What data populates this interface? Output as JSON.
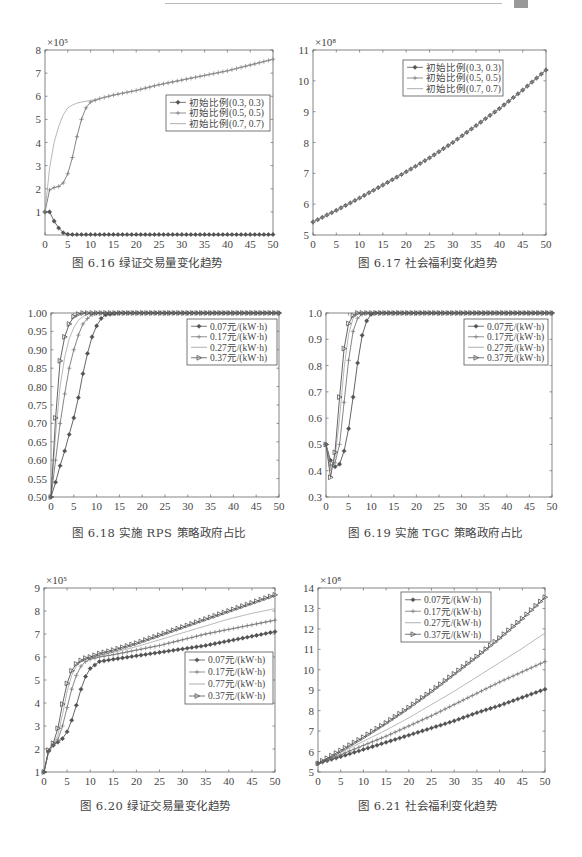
{
  "page": {
    "header_decoration": true
  },
  "figures": [
    {
      "id": "fig-6-16",
      "caption": "图 6.16   绿证交易量变化趋势",
      "caption_pos": [
        72,
        254
      ],
      "box": [
        45,
        50,
        273,
        235
      ],
      "xlim": [
        0,
        50
      ],
      "ylim": [
        0,
        8
      ],
      "xticks": [
        0,
        5,
        10,
        15,
        20,
        25,
        30,
        35,
        40,
        45,
        50
      ],
      "yticks": [
        1,
        2,
        3,
        4,
        5,
        6,
        7,
        8
      ],
      "ytick_labels": [
        "1",
        "2",
        "3",
        "4",
        "5",
        "6",
        "7",
        "8"
      ],
      "ytick_show_zero_label": false,
      "exponent": "×10⁵",
      "legend": {
        "pos": [
          166,
          95
        ],
        "w": 104,
        "h": 36
      }
    },
    {
      "id": "fig-6-17",
      "caption": "图 6.17   社会福利变化趋势",
      "caption_pos": [
        358,
        254
      ],
      "box": [
        313,
        50,
        546,
        235
      ],
      "xlim": [
        0,
        50
      ],
      "ylim": [
        5,
        11
      ],
      "xticks": [
        0,
        5,
        10,
        15,
        20,
        25,
        30,
        35,
        40,
        45,
        50
      ],
      "yticks": [
        5,
        6,
        7,
        8,
        9,
        10,
        11
      ],
      "ytick_labels": [
        "5",
        "6",
        "7",
        "8",
        "9",
        "10",
        "11"
      ],
      "exponent": "×10⁸",
      "legend": {
        "pos": [
          403,
          60
        ],
        "w": 100,
        "h": 36
      }
    },
    {
      "id": "fig-6-18",
      "caption": "图 6.18   实施 RPS 策略政府占比",
      "caption_pos": [
        72,
        525
      ],
      "box": [
        51,
        313,
        279,
        497
      ],
      "xlim": [
        0,
        50
      ],
      "ylim": [
        0.5,
        1.0
      ],
      "xticks": [
        0,
        5,
        10,
        15,
        20,
        25,
        30,
        35,
        40,
        45,
        50
      ],
      "yticks": [
        0.5,
        0.55,
        0.6,
        0.65,
        0.7,
        0.75,
        0.8,
        0.85,
        0.9,
        0.95,
        1.0
      ],
      "ytick_labels": [
        "0.50",
        "0.55",
        "0.60",
        "0.65",
        "0.70",
        "0.75",
        "0.80",
        "0.85",
        "0.90",
        "0.95",
        "1.00"
      ],
      "exponent": "",
      "legend": {
        "pos": [
          187,
          319
        ],
        "w": 90,
        "h": 46
      }
    },
    {
      "id": "fig-6-19",
      "caption": "图 6.19   实施 TGC 策略政府占比",
      "caption_pos": [
        348,
        525
      ],
      "box": [
        326,
        313,
        552,
        497
      ],
      "xlim": [
        0,
        50
      ],
      "ylim": [
        0.3,
        1.0
      ],
      "xticks": [
        0,
        5,
        10,
        15,
        20,
        25,
        30,
        35,
        40,
        45,
        50
      ],
      "yticks": [
        0.3,
        0.4,
        0.5,
        0.6,
        0.7,
        0.8,
        0.9,
        1.0
      ],
      "ytick_labels": [
        "0.3",
        "0.4",
        "0.5",
        "0.6",
        "0.7",
        "0.8",
        "0.9",
        "1.0"
      ],
      "exponent": "",
      "legend": {
        "pos": [
          464,
          319
        ],
        "w": 84,
        "h": 46
      }
    },
    {
      "id": "fig-6-20",
      "caption": "图 6.20   绿证交易量变化趋势",
      "caption_pos": [
        80,
        797
      ],
      "box": [
        44,
        588,
        275,
        772
      ],
      "xlim": [
        0,
        50
      ],
      "ylim": [
        1,
        9
      ],
      "xticks": [
        0,
        5,
        10,
        15,
        20,
        25,
        30,
        35,
        40,
        45,
        50
      ],
      "yticks": [
        1,
        2,
        3,
        4,
        5,
        6,
        7,
        8,
        9
      ],
      "ytick_labels": [
        "1",
        "2",
        "3",
        "4",
        "5",
        "6",
        "7",
        "8",
        "9"
      ],
      "exponent": "×10⁵",
      "legend": {
        "pos": [
          185,
          652
        ],
        "w": 88,
        "h": 52
      }
    },
    {
      "id": "fig-6-21",
      "caption": "图 6.21   社会福利变化趋势",
      "caption_pos": [
        358,
        797
      ],
      "box": [
        318,
        588,
        545,
        772
      ],
      "xlim": [
        0,
        50
      ],
      "ylim": [
        5,
        14
      ],
      "xticks": [
        0,
        5,
        10,
        15,
        20,
        25,
        30,
        35,
        40,
        45,
        50
      ],
      "yticks": [
        5,
        6,
        7,
        8,
        9,
        10,
        11,
        12,
        13,
        14
      ],
      "ytick_labels": [
        "5",
        "6",
        "7",
        "8",
        "9",
        "10",
        "11",
        "12",
        "13",
        "14"
      ],
      "exponent": "×10⁸",
      "legend": {
        "pos": [
          401,
          592
        ],
        "w": 90,
        "h": 50
      }
    }
  ],
  "chart_data": [
    {
      "type": "line",
      "title": "图 6.16 绿证交易量变化趋势",
      "xlabel": "",
      "ylabel": "",
      "y_multiplier": "×10^5",
      "xlim": [
        0,
        50
      ],
      "ylim": [
        0,
        8
      ],
      "grid": false,
      "legend_position": "upper right (inside)",
      "x": [
        0,
        1,
        2,
        3,
        4,
        5,
        6,
        7,
        8,
        9,
        10,
        12,
        15,
        20,
        25,
        30,
        35,
        40,
        45,
        50
      ],
      "series": [
        {
          "name": "初始比例(0.3, 0.3)",
          "marker": "asterisk",
          "values": [
            1.0,
            1.0,
            0.6,
            0.3,
            0.1,
            0.03,
            0.02,
            0.02,
            0.02,
            0.02,
            0.02,
            0.02,
            0.02,
            0.02,
            0.02,
            0.02,
            0.02,
            0.02,
            0.02,
            0.02
          ]
        },
        {
          "name": "初始比例(0.5, 0.5)",
          "marker": "plus",
          "values": [
            1.0,
            1.95,
            2.05,
            2.1,
            2.25,
            2.65,
            3.35,
            4.25,
            5.0,
            5.5,
            5.75,
            5.9,
            6.05,
            6.25,
            6.5,
            6.7,
            6.9,
            7.1,
            7.35,
            7.6
          ]
        },
        {
          "name": "初始比例(0.7, 0.7)",
          "marker": "none",
          "values": [
            1.0,
            2.9,
            4.0,
            4.7,
            5.2,
            5.5,
            5.62,
            5.7,
            5.75,
            5.78,
            5.82,
            5.9,
            6.05,
            6.25,
            6.5,
            6.7,
            6.9,
            7.1,
            7.35,
            7.6
          ]
        }
      ]
    },
    {
      "type": "line",
      "title": "图 6.17 社会福利变化趋势",
      "xlabel": "",
      "ylabel": "",
      "y_multiplier": "×10^8",
      "xlim": [
        0,
        50
      ],
      "ylim": [
        5,
        11
      ],
      "grid": false,
      "legend_position": "upper center (inside)",
      "x": [
        0,
        5,
        10,
        15,
        20,
        25,
        30,
        35,
        40,
        45,
        50
      ],
      "series": [
        {
          "name": "初始比例(0.3, 0.3)",
          "marker": "asterisk",
          "values": [
            5.42,
            5.8,
            6.2,
            6.62,
            7.05,
            7.5,
            8.0,
            8.55,
            9.1,
            9.7,
            10.35
          ]
        },
        {
          "name": "初始比例(0.5, 0.5)",
          "marker": "plus",
          "values": [
            5.42,
            5.8,
            6.2,
            6.62,
            7.05,
            7.5,
            8.0,
            8.55,
            9.1,
            9.7,
            10.35
          ]
        },
        {
          "name": "初始比例(0.7, 0.7)",
          "marker": "none",
          "values": [
            5.42,
            5.8,
            6.2,
            6.62,
            7.05,
            7.5,
            8.0,
            8.55,
            9.1,
            9.7,
            10.35
          ]
        }
      ]
    },
    {
      "type": "line",
      "title": "图 6.18 实施 RPS 策略政府占比",
      "xlabel": "",
      "ylabel": "",
      "xlim": [
        0,
        50
      ],
      "ylim": [
        0.5,
        1.0
      ],
      "grid": false,
      "legend_position": "upper right (inside)",
      "x": [
        0,
        1,
        2,
        3,
        4,
        5,
        6,
        7,
        8,
        9,
        10,
        11,
        12,
        15,
        20,
        25,
        30,
        35,
        40,
        45,
        50
      ],
      "series": [
        {
          "name": "0.07元/(kW·h)",
          "marker": "asterisk",
          "values": [
            0.5,
            0.54,
            0.585,
            0.625,
            0.67,
            0.715,
            0.77,
            0.835,
            0.89,
            0.935,
            0.965,
            0.985,
            0.995,
            1.0,
            1.0,
            1.0,
            1.0,
            1.0,
            1.0,
            1.0,
            1.0
          ]
        },
        {
          "name": "0.17元/(kW·h)",
          "marker": "plus",
          "values": [
            0.5,
            0.6,
            0.7,
            0.78,
            0.85,
            0.9,
            0.94,
            0.97,
            0.985,
            0.995,
            1.0,
            1.0,
            1.0,
            1.0,
            1.0,
            1.0,
            1.0,
            1.0,
            1.0,
            1.0,
            1.0
          ]
        },
        {
          "name": "0.27元/(kW·h)",
          "marker": "none",
          "values": [
            0.5,
            0.67,
            0.8,
            0.88,
            0.93,
            0.96,
            0.98,
            0.99,
            0.997,
            1.0,
            1.0,
            1.0,
            1.0,
            1.0,
            1.0,
            1.0,
            1.0,
            1.0,
            1.0,
            1.0,
            1.0
          ]
        },
        {
          "name": "0.37元/(kW·h)",
          "marker": "triangle-right",
          "values": [
            0.5,
            0.715,
            0.87,
            0.935,
            0.97,
            0.99,
            0.997,
            1.0,
            1.0,
            1.0,
            1.0,
            1.0,
            1.0,
            1.0,
            1.0,
            1.0,
            1.0,
            1.0,
            1.0,
            1.0,
            1.0
          ]
        }
      ]
    },
    {
      "type": "line",
      "title": "图 6.19 实施 TGC 策略政府占比",
      "xlabel": "",
      "ylabel": "",
      "xlim": [
        0,
        50
      ],
      "ylim": [
        0.3,
        1.0
      ],
      "grid": false,
      "legend_position": "upper right (inside)",
      "x": [
        0,
        1,
        2,
        3,
        4,
        5,
        6,
        7,
        8,
        9,
        10,
        11,
        12,
        15,
        20,
        25,
        30,
        35,
        40,
        45,
        50
      ],
      "series": [
        {
          "name": "0.07元/(kW·h)",
          "marker": "asterisk",
          "values": [
            0.5,
            0.44,
            0.415,
            0.425,
            0.475,
            0.56,
            0.68,
            0.81,
            0.915,
            0.97,
            0.995,
            1.0,
            1.0,
            1.0,
            1.0,
            1.0,
            1.0,
            1.0,
            1.0,
            1.0,
            1.0
          ]
        },
        {
          "name": "0.17元/(kW·h)",
          "marker": "plus",
          "values": [
            0.5,
            0.42,
            0.43,
            0.5,
            0.66,
            0.82,
            0.93,
            0.98,
            0.995,
            1.0,
            1.0,
            1.0,
            1.0,
            1.0,
            1.0,
            1.0,
            1.0,
            1.0,
            1.0,
            1.0,
            1.0
          ]
        },
        {
          "name": "0.27元/(kW·h)",
          "marker": "none",
          "values": [
            0.5,
            0.4,
            0.45,
            0.6,
            0.79,
            0.92,
            0.98,
            0.995,
            1.0,
            1.0,
            1.0,
            1.0,
            1.0,
            1.0,
            1.0,
            1.0,
            1.0,
            1.0,
            1.0,
            1.0,
            1.0
          ]
        },
        {
          "name": "0.37元/(kW·h)",
          "marker": "triangle-right",
          "values": [
            0.5,
            0.375,
            0.47,
            0.68,
            0.865,
            0.96,
            0.99,
            1.0,
            1.0,
            1.0,
            1.0,
            1.0,
            1.0,
            1.0,
            1.0,
            1.0,
            1.0,
            1.0,
            1.0,
            1.0,
            1.0
          ]
        }
      ]
    },
    {
      "type": "line",
      "title": "图 6.20 绿证交易量变化趋势",
      "xlabel": "",
      "ylabel": "",
      "y_multiplier": "×10^5",
      "xlim": [
        0,
        50
      ],
      "ylim": [
        1,
        9
      ],
      "grid": false,
      "legend_position": "right (inside)",
      "legend_note": "third legend entry is printed as '0.77元/(kW·h)' in the source (likely a typo for 0.27)",
      "x": [
        0,
        1,
        2,
        3,
        4,
        5,
        6,
        7,
        8,
        9,
        10,
        12,
        15,
        20,
        25,
        30,
        35,
        40,
        45,
        50
      ],
      "series": [
        {
          "name": "0.07元/(kW·h)",
          "marker": "asterisk",
          "values": [
            1.0,
            1.9,
            2.15,
            2.3,
            2.45,
            2.75,
            3.25,
            3.9,
            4.6,
            5.15,
            5.5,
            5.8,
            5.9,
            6.05,
            6.2,
            6.35,
            6.5,
            6.7,
            6.9,
            7.1
          ]
        },
        {
          "name": "0.17元/(kW·h)",
          "marker": "plus",
          "values": [
            1.0,
            1.9,
            2.2,
            2.4,
            3.0,
            3.8,
            4.6,
            5.2,
            5.6,
            5.8,
            5.9,
            6.0,
            6.1,
            6.3,
            6.5,
            6.75,
            7.0,
            7.2,
            7.4,
            7.6
          ]
        },
        {
          "name": "0.77元/(kW·h)",
          "marker": "none",
          "values": [
            1.0,
            1.9,
            2.2,
            2.6,
            3.5,
            4.5,
            5.2,
            5.6,
            5.8,
            5.9,
            5.95,
            6.05,
            6.2,
            6.45,
            6.75,
            7.05,
            7.35,
            7.65,
            7.9,
            8.1
          ]
        },
        {
          "name": "0.37元/(kW·h)",
          "marker": "triangle-right",
          "values": [
            1.0,
            1.95,
            2.25,
            2.9,
            3.95,
            4.85,
            5.4,
            5.7,
            5.85,
            5.95,
            6.0,
            6.15,
            6.3,
            6.6,
            6.95,
            7.3,
            7.65,
            8.0,
            8.35,
            8.7
          ]
        }
      ]
    },
    {
      "type": "line",
      "title": "图 6.21 社会福利变化趋势",
      "xlabel": "",
      "ylabel": "",
      "y_multiplier": "×10^8",
      "xlim": [
        0,
        50
      ],
      "ylim": [
        5,
        14
      ],
      "grid": false,
      "legend_position": "upper center (inside)",
      "x": [
        0,
        5,
        10,
        15,
        20,
        25,
        30,
        35,
        40,
        45,
        50
      ],
      "series": [
        {
          "name": "0.07元/(kW·h)",
          "marker": "asterisk",
          "values": [
            5.42,
            5.75,
            6.1,
            6.45,
            6.8,
            7.15,
            7.5,
            7.9,
            8.25,
            8.65,
            9.05
          ]
        },
        {
          "name": "0.17元/(kW·h)",
          "marker": "plus",
          "values": [
            5.42,
            5.85,
            6.3,
            6.75,
            7.25,
            7.75,
            8.3,
            8.85,
            9.4,
            9.9,
            10.4
          ]
        },
        {
          "name": "0.27元/(kW·h)",
          "marker": "none",
          "values": [
            5.42,
            5.95,
            6.5,
            7.05,
            7.65,
            8.3,
            8.95,
            9.65,
            10.35,
            11.05,
            11.8
          ]
        },
        {
          "name": "0.37元/(kW·h)",
          "marker": "triangle-right",
          "values": [
            5.42,
            6.05,
            6.7,
            7.4,
            8.15,
            8.95,
            9.8,
            10.65,
            11.55,
            12.5,
            13.55
          ]
        }
      ]
    }
  ]
}
